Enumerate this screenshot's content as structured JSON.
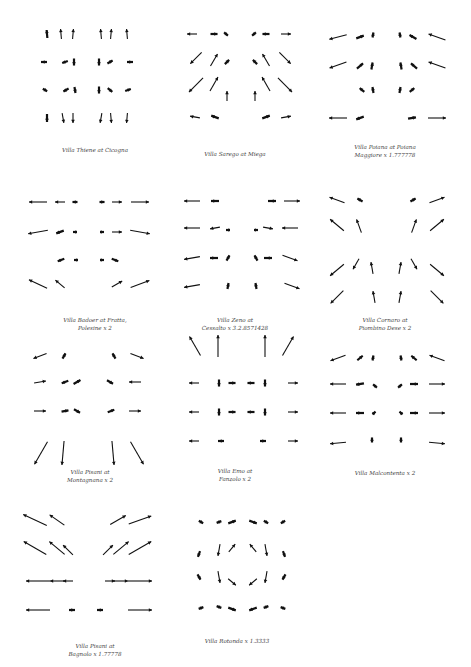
{
  "style": {
    "arrow_color": "#111111",
    "caption_color": "#444444",
    "background": "#ffffff"
  },
  "panels": [
    {
      "id": "thiene",
      "caption": "Villa Thiene at Cicogna",
      "cx": 95,
      "cap_y": 146,
      "arrows": [
        [
          47,
          34,
          95,
          8
        ],
        [
          61,
          34,
          95,
          10
        ],
        [
          73,
          34,
          85,
          10
        ],
        [
          101,
          34,
          95,
          10
        ],
        [
          111,
          34,
          85,
          10
        ],
        [
          127,
          34,
          95,
          10
        ],
        [
          44,
          62,
          0,
          6
        ],
        [
          65,
          62,
          200,
          6
        ],
        [
          74,
          62,
          270,
          7
        ],
        [
          99,
          62,
          270,
          7
        ],
        [
          110,
          62,
          30,
          6
        ],
        [
          130,
          62,
          180,
          6
        ],
        [
          45,
          90,
          330,
          5
        ],
        [
          66,
          90,
          210,
          6
        ],
        [
          75,
          90,
          280,
          6
        ],
        [
          99,
          90,
          270,
          7
        ],
        [
          110,
          90,
          320,
          6
        ],
        [
          128,
          90,
          20,
          6
        ],
        [
          47,
          118,
          270,
          8
        ],
        [
          63,
          118,
          280,
          10
        ],
        [
          73,
          118,
          270,
          10
        ],
        [
          101,
          118,
          260,
          10
        ],
        [
          111,
          118,
          275,
          10
        ],
        [
          127,
          118,
          265,
          10
        ]
      ]
    },
    {
      "id": "sarego",
      "caption": "Villa Sarego at Miega",
      "cx": 235,
      "cap_y": 150,
      "arrows": [
        [
          192,
          34,
          180,
          10
        ],
        [
          214,
          34,
          0,
          7
        ],
        [
          226,
          34,
          320,
          5
        ],
        [
          254,
          34,
          220,
          5
        ],
        [
          266,
          34,
          180,
          7
        ],
        [
          286,
          34,
          0,
          10
        ],
        [
          196,
          58,
          225,
          16
        ],
        [
          214,
          60,
          60,
          14
        ],
        [
          227,
          62,
          45,
          6
        ],
        [
          255,
          62,
          135,
          6
        ],
        [
          266,
          60,
          120,
          14
        ],
        [
          285,
          58,
          315,
          16
        ],
        [
          196,
          85,
          225,
          20
        ],
        [
          214,
          84,
          60,
          16
        ],
        [
          227,
          96,
          90,
          10
        ],
        [
          255,
          96,
          90,
          10
        ],
        [
          266,
          84,
          120,
          16
        ],
        [
          285,
          85,
          315,
          20
        ],
        [
          195,
          117,
          170,
          10
        ],
        [
          215,
          117,
          160,
          8
        ],
        [
          266,
          117,
          20,
          8
        ],
        [
          286,
          117,
          10,
          10
        ]
      ]
    },
    {
      "id": "poiana",
      "caption": "Villa Poiana at Poiana\nMaggiore x 1.777778",
      "cx": 385,
      "cap_y": 143,
      "arrows": [
        [
          338,
          37,
          195,
          18
        ],
        [
          360,
          37,
          20,
          8
        ],
        [
          373,
          35,
          80,
          5
        ],
        [
          400,
          35,
          100,
          5
        ],
        [
          413,
          37,
          150,
          8
        ],
        [
          437,
          37,
          160,
          18
        ],
        [
          338,
          65,
          200,
          18
        ],
        [
          360,
          66,
          40,
          8
        ],
        [
          372,
          66,
          80,
          7
        ],
        [
          401,
          66,
          100,
          7
        ],
        [
          414,
          66,
          140,
          8
        ],
        [
          437,
          65,
          160,
          18
        ],
        [
          362,
          90,
          140,
          6
        ],
        [
          373,
          90,
          100,
          6
        ],
        [
          400,
          90,
          80,
          6
        ],
        [
          412,
          90,
          40,
          6
        ],
        [
          338,
          118,
          180,
          18
        ],
        [
          360,
          118,
          200,
          8
        ],
        [
          412,
          118,
          10,
          8
        ],
        [
          437,
          118,
          0,
          18
        ]
      ]
    },
    {
      "id": "badoer",
      "caption": "Villa Badoer at Fratta,\nPolesine x 2",
      "cx": 95,
      "cap_y": 316,
      "arrows": [
        [
          38,
          202,
          180,
          18
        ],
        [
          60,
          202,
          180,
          10
        ],
        [
          75,
          202,
          180,
          5
        ],
        [
          102,
          202,
          0,
          5
        ],
        [
          117,
          202,
          0,
          10
        ],
        [
          140,
          202,
          0,
          18
        ],
        [
          38,
          232,
          190,
          20
        ],
        [
          60,
          232,
          200,
          8
        ],
        [
          75,
          232,
          180,
          4
        ],
        [
          102,
          232,
          0,
          4
        ],
        [
          117,
          232,
          0,
          10
        ],
        [
          140,
          232,
          350,
          20
        ],
        [
          61,
          260,
          200,
          7
        ],
        [
          76,
          260,
          180,
          4
        ],
        [
          102,
          260,
          0,
          4
        ],
        [
          115,
          260,
          340,
          7
        ],
        [
          38,
          284,
          155,
          20
        ],
        [
          60,
          284,
          140,
          12
        ],
        [
          117,
          284,
          30,
          12
        ],
        [
          140,
          284,
          20,
          20
        ]
      ]
    },
    {
      "id": "zeno",
      "caption": "Villa Zeno at\nCessalto x 3.2.8571428",
      "cx": 235,
      "cap_y": 316,
      "arrows": [
        [
          192,
          201,
          180,
          16
        ],
        [
          215,
          201,
          180,
          8
        ],
        [
          272,
          201,
          0,
          8
        ],
        [
          292,
          201,
          0,
          16
        ],
        [
          192,
          228,
          180,
          16
        ],
        [
          215,
          228,
          190,
          10
        ],
        [
          228,
          230,
          180,
          4
        ],
        [
          256,
          230,
          0,
          4
        ],
        [
          268,
          228,
          350,
          10
        ],
        [
          290,
          228,
          180,
          16
        ],
        [
          192,
          258,
          190,
          16
        ],
        [
          214,
          258,
          180,
          8
        ],
        [
          228,
          258,
          60,
          6
        ],
        [
          256,
          258,
          120,
          6
        ],
        [
          268,
          258,
          0,
          8
        ],
        [
          290,
          258,
          340,
          16
        ],
        [
          192,
          286,
          190,
          16
        ],
        [
          228,
          286,
          80,
          6
        ],
        [
          256,
          286,
          100,
          6
        ],
        [
          292,
          286,
          340,
          16
        ]
      ]
    },
    {
      "id": "cornaro",
      "caption": "Villa Cornaro at\nPiombino Dese x 2",
      "cx": 385,
      "cap_y": 316,
      "arrows": [
        [
          337,
          200,
          160,
          16
        ],
        [
          360,
          200,
          150,
          6
        ],
        [
          413,
          200,
          30,
          6
        ],
        [
          437,
          200,
          20,
          16
        ],
        [
          337,
          225,
          140,
          18
        ],
        [
          359,
          226,
          110,
          14
        ],
        [
          414,
          226,
          70,
          14
        ],
        [
          437,
          225,
          40,
          18
        ],
        [
          337,
          270,
          220,
          18
        ],
        [
          356,
          264,
          240,
          12
        ],
        [
          372,
          268,
          100,
          12
        ],
        [
          400,
          268,
          80,
          12
        ],
        [
          414,
          264,
          300,
          12
        ],
        [
          437,
          270,
          320,
          18
        ],
        [
          337,
          297,
          225,
          18
        ],
        [
          374,
          297,
          100,
          12
        ],
        [
          400,
          297,
          80,
          12
        ],
        [
          437,
          297,
          315,
          18
        ]
      ]
    },
    {
      "id": "pisani-m",
      "caption": "Villa Pisani at\nMontagnana x 2",
      "cx": 90,
      "cap_y": 468,
      "arrows": [
        [
          40,
          356,
          200,
          14
        ],
        [
          64,
          356,
          60,
          6
        ],
        [
          114,
          356,
          120,
          6
        ],
        [
          137,
          356,
          340,
          14
        ],
        [
          40,
          382,
          10,
          12
        ],
        [
          65,
          382,
          200,
          7
        ],
        [
          77,
          382,
          30,
          8
        ],
        [
          110,
          382,
          330,
          7
        ],
        [
          135,
          382,
          180,
          12
        ],
        [
          40,
          411,
          0,
          12
        ],
        [
          65,
          411,
          10,
          7
        ],
        [
          77,
          411,
          330,
          7
        ],
        [
          111,
          411,
          20,
          7
        ],
        [
          135,
          411,
          0,
          12
        ],
        [
          41,
          453,
          240,
          26
        ],
        [
          63,
          453,
          265,
          24
        ],
        [
          113,
          453,
          275,
          24
        ],
        [
          137,
          453,
          300,
          26
        ]
      ]
    },
    {
      "id": "emo",
      "caption": "Villa Emo at\nFanzolo x 2",
      "cx": 235,
      "cap_y": 467,
      "arrows": [
        [
          195,
          346,
          120,
          22
        ],
        [
          218,
          346,
          90,
          22
        ],
        [
          265,
          346,
          90,
          22
        ],
        [
          288,
          346,
          60,
          22
        ],
        [
          194,
          383,
          180,
          10
        ],
        [
          219,
          383,
          270,
          7
        ],
        [
          232,
          383,
          0,
          7
        ],
        [
          251,
          383,
          180,
          7
        ],
        [
          265,
          383,
          270,
          7
        ],
        [
          293,
          383,
          0,
          10
        ],
        [
          194,
          412,
          180,
          10
        ],
        [
          219,
          412,
          270,
          7
        ],
        [
          232,
          412,
          0,
          7
        ],
        [
          251,
          412,
          180,
          7
        ],
        [
          265,
          412,
          270,
          7
        ],
        [
          293,
          412,
          0,
          10
        ],
        [
          194,
          441,
          180,
          10
        ],
        [
          221,
          441,
          0,
          6
        ],
        [
          263,
          441,
          180,
          6
        ],
        [
          293,
          441,
          0,
          10
        ]
      ]
    },
    {
      "id": "malcontenta",
      "caption": "Villa Malcontenta x 2",
      "cx": 385,
      "cap_y": 469,
      "arrows": [
        [
          338,
          358,
          200,
          16
        ],
        [
          360,
          358,
          40,
          7
        ],
        [
          373,
          358,
          80,
          5
        ],
        [
          401,
          358,
          100,
          5
        ],
        [
          414,
          358,
          140,
          7
        ],
        [
          437,
          358,
          160,
          16
        ],
        [
          338,
          384,
          180,
          16
        ],
        [
          360,
          384,
          190,
          8
        ],
        [
          375,
          386,
          140,
          5
        ],
        [
          400,
          386,
          40,
          5
        ],
        [
          414,
          384,
          0,
          8
        ],
        [
          437,
          384,
          0,
          16
        ],
        [
          338,
          413,
          180,
          16
        ],
        [
          360,
          413,
          180,
          8
        ],
        [
          374,
          413,
          40,
          4
        ],
        [
          401,
          413,
          140,
          4
        ],
        [
          414,
          413,
          0,
          8
        ],
        [
          437,
          413,
          0,
          16
        ],
        [
          338,
          443,
          185,
          16
        ],
        [
          372,
          440,
          90,
          5
        ],
        [
          401,
          440,
          90,
          5
        ],
        [
          437,
          443,
          355,
          16
        ]
      ]
    },
    {
      "id": "pisani-b",
      "caption": "Villa Pisani at\nBagnolo x 1.77778",
      "cx": 95,
      "cap_y": 642,
      "arrows": [
        [
          35,
          520,
          155,
          26
        ],
        [
          57,
          520,
          145,
          18
        ],
        [
          118,
          520,
          30,
          18
        ],
        [
          140,
          520,
          20,
          24
        ],
        [
          35,
          548,
          150,
          26
        ],
        [
          57,
          548,
          140,
          20
        ],
        [
          68,
          550,
          135,
          14
        ],
        [
          108,
          550,
          45,
          14
        ],
        [
          121,
          548,
          40,
          20
        ],
        [
          140,
          548,
          30,
          26
        ],
        [
          38,
          581,
          180,
          24
        ],
        [
          57,
          581,
          180,
          14
        ],
        [
          68,
          581,
          180,
          10
        ],
        [
          110,
          581,
          0,
          10
        ],
        [
          121,
          581,
          0,
          14
        ],
        [
          140,
          581,
          0,
          24
        ],
        [
          38,
          610,
          180,
          24
        ],
        [
          72,
          610,
          180,
          6
        ],
        [
          100,
          610,
          0,
          6
        ],
        [
          140,
          610,
          0,
          24
        ]
      ]
    },
    {
      "id": "rotonda",
      "caption": "Villa Rotonda x 1.3333",
      "cx": 237,
      "cap_y": 637,
      "arrows": [
        [
          201,
          522,
          330,
          5
        ],
        [
          219,
          522,
          200,
          5
        ],
        [
          232,
          522,
          20,
          8
        ],
        [
          253,
          522,
          340,
          8
        ],
        [
          266,
          522,
          330,
          5
        ],
        [
          283,
          522,
          210,
          5
        ],
        [
          199,
          554,
          250,
          6
        ],
        [
          219,
          550,
          260,
          12
        ],
        [
          232,
          548,
          50,
          10
        ],
        [
          253,
          548,
          130,
          10
        ],
        [
          266,
          550,
          280,
          12
        ],
        [
          284,
          554,
          290,
          6
        ],
        [
          199,
          577,
          300,
          6
        ],
        [
          219,
          577,
          280,
          12
        ],
        [
          232,
          582,
          320,
          10
        ],
        [
          253,
          582,
          220,
          10
        ],
        [
          266,
          577,
          260,
          12
        ],
        [
          284,
          577,
          240,
          6
        ],
        [
          201,
          608,
          20,
          5
        ],
        [
          219,
          607,
          160,
          5
        ],
        [
          232,
          609,
          340,
          8
        ],
        [
          253,
          609,
          200,
          8
        ],
        [
          266,
          607,
          20,
          5
        ],
        [
          283,
          608,
          160,
          5
        ]
      ]
    }
  ]
}
